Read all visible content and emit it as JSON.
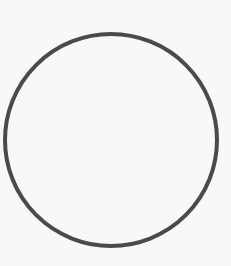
{
  "figure": {
    "shape": "circle",
    "stroke_color": "#4a4a4a",
    "fill_color": "none",
    "background_color": "#f8f8f8",
    "center": [
      111,
      140
    ],
    "radius": 106,
    "stroke_width": 4
  }
}
